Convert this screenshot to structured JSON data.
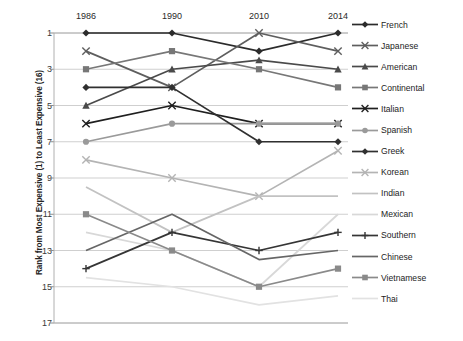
{
  "chart_data": {
    "type": "line",
    "title": "",
    "xlabel": "",
    "ylabel": "Rank from Most Expensive (1) to Least Expensive (16)",
    "categories": [
      "1986",
      "1990",
      "2010",
      "2014"
    ],
    "yticks": [
      1,
      3,
      5,
      7,
      9,
      11,
      13,
      15,
      17
    ],
    "ylim": [
      1,
      17
    ],
    "y_inverted": true,
    "grid": "horizontal",
    "legend_position": "right",
    "series": [
      {
        "name": "French",
        "values": [
          1,
          1,
          2,
          1
        ],
        "marker": "diamond",
        "color": "#2b2b2b"
      },
      {
        "name": "Japanese",
        "values": [
          2,
          4,
          1,
          2
        ],
        "marker": "x",
        "color": "#5e5e5e"
      },
      {
        "name": "American",
        "values": [
          5,
          3,
          2.5,
          3
        ],
        "marker": "triangle",
        "color": "#4a4a4a"
      },
      {
        "name": "Continental",
        "values": [
          3,
          2,
          3,
          4
        ],
        "marker": "square",
        "color": "#777777"
      },
      {
        "name": "Italian",
        "values": [
          6,
          5,
          6,
          6
        ],
        "marker": "x",
        "color": "#1f1f1f"
      },
      {
        "name": "Spanish",
        "values": [
          7,
          6,
          6,
          6
        ],
        "marker": "circle",
        "color": "#9a9a9a"
      },
      {
        "name": "Greek",
        "values": [
          4,
          4,
          7,
          7
        ],
        "marker": "diamond",
        "color": "#303030"
      },
      {
        "name": "Korean",
        "values": [
          8,
          9,
          10,
          7.5
        ],
        "marker": "x",
        "color": "#b4b4b4"
      },
      {
        "name": "Indian",
        "values": [
          9.5,
          12,
          10,
          10
        ],
        "marker": "none",
        "color": "#c2c2c2"
      },
      {
        "name": "Mexican",
        "values": [
          12,
          13,
          15,
          11
        ],
        "marker": "none",
        "color": "#d8d8d8"
      },
      {
        "name": "Southern",
        "values": [
          14,
          12,
          13,
          12
        ],
        "marker": "plus",
        "color": "#353535"
      },
      {
        "name": "Chinese",
        "values": [
          13,
          11,
          13.5,
          13
        ],
        "marker": "none",
        "color": "#666666"
      },
      {
        "name": "Vietnamese",
        "values": [
          11,
          13,
          15,
          14
        ],
        "marker": "square",
        "color": "#8a8a8a"
      },
      {
        "name": "Thai",
        "values": [
          14.5,
          15,
          16,
          15.5
        ],
        "marker": "none",
        "color": "#e2e2e2"
      }
    ]
  },
  "axis": {
    "y_title": "Rank from Most Expensive (1) to Least Expensive (16)",
    "y_tick_labels": [
      "1",
      "3",
      "5",
      "7",
      "9",
      "11",
      "13",
      "15",
      "17"
    ],
    "x_tick_labels": [
      "1986",
      "1990",
      "2010",
      "2014"
    ]
  },
  "legend": {
    "entries": [
      {
        "label": "French"
      },
      {
        "label": "Japanese"
      },
      {
        "label": "American"
      },
      {
        "label": "Continental"
      },
      {
        "label": "Italian"
      },
      {
        "label": "Spanish"
      },
      {
        "label": "Greek"
      },
      {
        "label": "Korean"
      },
      {
        "label": "Indian"
      },
      {
        "label": "Mexican"
      },
      {
        "label": "Southern"
      },
      {
        "label": "Chinese"
      },
      {
        "label": "Vietnamese"
      },
      {
        "label": "Thai"
      }
    ]
  }
}
